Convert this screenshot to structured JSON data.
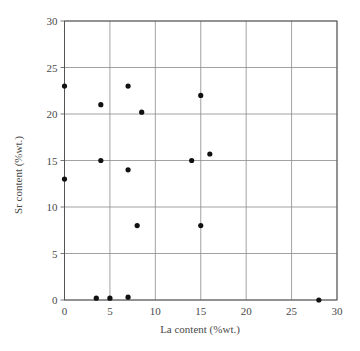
{
  "chart_data": {
    "type": "scatter",
    "title": "",
    "xlabel": "La content (%wt.)",
    "ylabel": "Sr content (%wt.)",
    "xlim": [
      0,
      30
    ],
    "ylim": [
      0,
      30
    ],
    "xticks": [
      0,
      5,
      10,
      15,
      20,
      25,
      30
    ],
    "yticks": [
      0,
      5,
      10,
      15,
      20,
      25,
      30
    ],
    "grid": true,
    "legend": null,
    "marker_color": "#111111",
    "series": [
      {
        "name": "samples",
        "points": [
          {
            "x": 0,
            "y": 23
          },
          {
            "x": 0,
            "y": 13
          },
          {
            "x": 3.5,
            "y": 0.2
          },
          {
            "x": 4,
            "y": 21
          },
          {
            "x": 4,
            "y": 15
          },
          {
            "x": 5,
            "y": 0.2
          },
          {
            "x": 7,
            "y": 23
          },
          {
            "x": 7,
            "y": 14
          },
          {
            "x": 7,
            "y": 0.3
          },
          {
            "x": 8,
            "y": 8
          },
          {
            "x": 8.5,
            "y": 20.2
          },
          {
            "x": 14,
            "y": 15
          },
          {
            "x": 15,
            "y": 22
          },
          {
            "x": 15,
            "y": 8
          },
          {
            "x": 16,
            "y": 15.7
          },
          {
            "x": 28,
            "y": 0
          }
        ]
      }
    ]
  }
}
